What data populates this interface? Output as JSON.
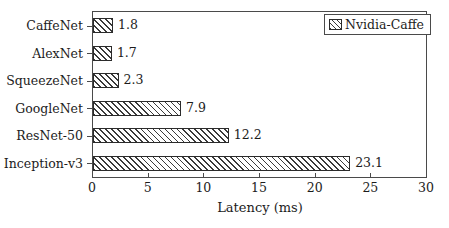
{
  "chart_data": {
    "type": "bar",
    "orientation": "horizontal",
    "title": "",
    "xlabel": "Latency (ms)",
    "ylabel": "",
    "xlim": [
      0,
      30
    ],
    "xticks": [
      0,
      5,
      10,
      15,
      20,
      25,
      30
    ],
    "xtick_labels": [
      "0",
      "5",
      "10",
      "15",
      "20",
      "25",
      "30"
    ],
    "grid": false,
    "legend": {
      "position": "top-right",
      "entries": [
        {
          "label": "Nvidia-Caffe",
          "pattern": "diagonal-hatch",
          "color": "#3a3a3a"
        }
      ]
    },
    "categories": [
      "CaffeNet",
      "AlexNet",
      "SqueezeNet",
      "GoogleNet",
      "ResNet-50",
      "Inception-v3"
    ],
    "series": [
      {
        "name": "Nvidia-Caffe",
        "values": [
          1.8,
          1.7,
          2.3,
          7.9,
          12.2,
          23.1
        ],
        "value_labels": [
          "1.8",
          "1.7",
          "2.3",
          "7.9",
          "12.2",
          "23.1"
        ]
      }
    ],
    "bars": [
      {
        "category": "CaffeNet",
        "value": 1.8,
        "label": "1.8"
      },
      {
        "category": "AlexNet",
        "value": 1.7,
        "label": "1.7"
      },
      {
        "category": "SqueezeNet",
        "value": 2.3,
        "label": "2.3"
      },
      {
        "category": "GoogleNet",
        "value": 7.9,
        "label": "7.9"
      },
      {
        "category": "ResNet-50",
        "value": 12.2,
        "label": "12.2"
      },
      {
        "category": "Inception-v3",
        "value": 23.1,
        "label": "23.1"
      }
    ],
    "colors": {
      "bar_outline": "#2b2b2b",
      "bar_hatch": "#3a3a3a",
      "bar_fill": "#ffffff",
      "axis": "#4a4a4a",
      "text": "#1c1c1c"
    }
  }
}
